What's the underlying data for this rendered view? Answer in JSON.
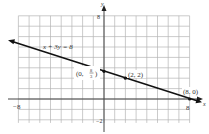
{
  "chart_data": {
    "type": "line",
    "title": "",
    "xlabel": "x",
    "ylabel": "y",
    "xlim": [
      -8,
      8
    ],
    "ylim": [
      -2,
      8
    ],
    "grid": true,
    "grid_step": 1,
    "x_ticks_labeled": [
      {
        "value": -8,
        "label": "−8"
      },
      {
        "value": 8,
        "label": "8"
      }
    ],
    "y_ticks_labeled": [
      {
        "value": 8,
        "label": "8"
      },
      {
        "value": -2,
        "label": "−2"
      }
    ],
    "series": [
      {
        "name": "x + 3y = 8",
        "equation": "x + 3y = 8",
        "line_endpoints": [
          [
            -8.8,
            5.6
          ],
          [
            9,
            -0.333
          ]
        ],
        "arrows": "both"
      }
    ],
    "points": [
      {
        "x": 0,
        "y": 2.667,
        "label_parts": {
          "pre": "(0, ",
          "num": "8",
          "den": "3",
          "post": ")"
        }
      },
      {
        "x": 2,
        "y": 2,
        "label": "(2, 2)"
      },
      {
        "x": 8,
        "y": 0,
        "label": "(8, 0)"
      }
    ],
    "annotations": [
      {
        "text": "x + 3y = 8",
        "x": -4.3,
        "y": 5.0
      }
    ]
  },
  "labels": {
    "x_axis": "x",
    "y_axis": "y",
    "x_min": "−8",
    "x_max": "8",
    "y_max": "8",
    "y_min": "−2",
    "equation": "x + 3y = 8",
    "p1_pre": "(0,",
    "p1_num": "8",
    "p1_den": "3",
    "p1_post": ")",
    "p2": "(2, 2)",
    "p3": "(8, 0)"
  }
}
